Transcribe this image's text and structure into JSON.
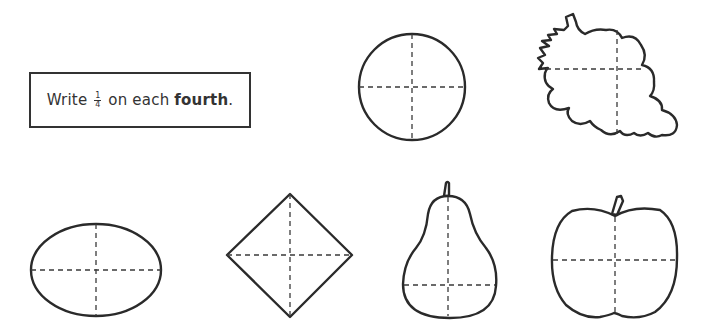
{
  "instruction": {
    "prefix": "Write",
    "fraction": {
      "numerator": "1",
      "denominator": "4"
    },
    "middle": "on each",
    "emphasis": "fourth",
    "suffix": "."
  },
  "shapes": [
    {
      "name": "circle",
      "divided_into": 4
    },
    {
      "name": "grapes",
      "divided_into": 4
    },
    {
      "name": "oval",
      "divided_into": 4
    },
    {
      "name": "diamond",
      "divided_into": 4
    },
    {
      "name": "pear",
      "divided_into": 4
    },
    {
      "name": "apple",
      "divided_into": 4
    }
  ],
  "colors": {
    "line": "#2a2a2a",
    "background": "#ffffff"
  }
}
